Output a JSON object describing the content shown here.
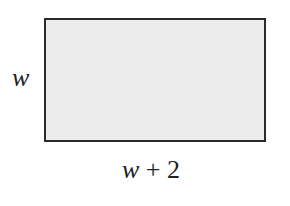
{
  "diagram": {
    "shape": "rectangle",
    "fill_color": "#ececec",
    "stroke_color": "#2a2a2a",
    "side_label": {
      "variable": "w"
    },
    "bottom_label": {
      "variable": "w",
      "operator": "+",
      "constant": "2"
    }
  }
}
